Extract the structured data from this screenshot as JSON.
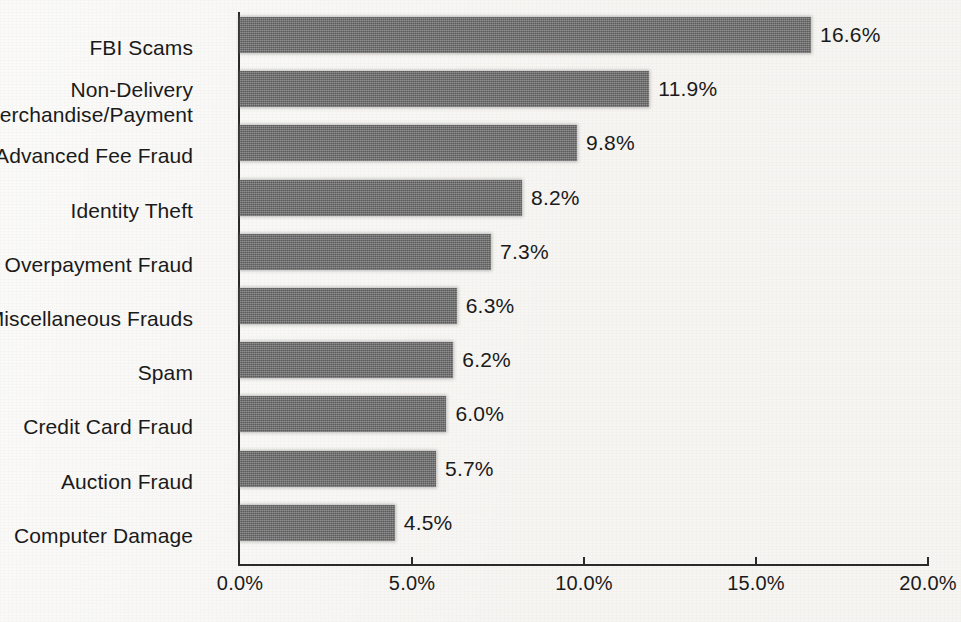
{
  "chart_data": {
    "type": "bar",
    "orientation": "horizontal",
    "title": "",
    "subtitle": "",
    "xlabel": "",
    "ylabel": "",
    "xlim": [
      0,
      20
    ],
    "grid": false,
    "legend": null,
    "bar_color": "#6e6e6e",
    "background_color": "#f6f5f2",
    "axis_color": "#2a2a2a",
    "value_suffix": "%",
    "xtick_labels": [
      "0.0%",
      "5.0%",
      "10.0%",
      "15.0%",
      "20.0%"
    ],
    "xtick_values": [
      0,
      5,
      10,
      15,
      20
    ],
    "categories": [
      "FBI Scams",
      "Non-Delivery\nMerchandise/Payment",
      "Advanced Fee Fraud",
      "Identity Theft",
      "Overpayment Fraud",
      "Miscellaneous Frauds",
      "Spam",
      "Credit Card Fraud",
      "Auction Fraud",
      "Computer Damage"
    ],
    "values": [
      16.6,
      11.9,
      9.8,
      8.2,
      7.3,
      6.3,
      6.2,
      6.0,
      5.7,
      4.5
    ],
    "data_labels": [
      "16.6%",
      "11.9%",
      "9.8%",
      "8.2%",
      "7.3%",
      "6.3%",
      "6.2%",
      "6.0%",
      "5.7%",
      "4.5%"
    ]
  }
}
